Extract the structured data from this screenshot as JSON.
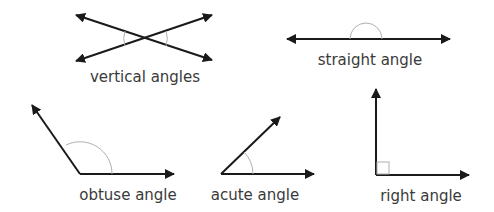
{
  "diagram": {
    "labels": {
      "vertical": "vertical angles",
      "straight": "straight angle",
      "obtuse": "obtuse angle",
      "acute": "acute angle",
      "right": "right angle"
    },
    "colors": {
      "line": "#1a1a1a",
      "arc": "#b0b0b0",
      "text": "#3a3a3a",
      "background": "#ffffff"
    }
  }
}
